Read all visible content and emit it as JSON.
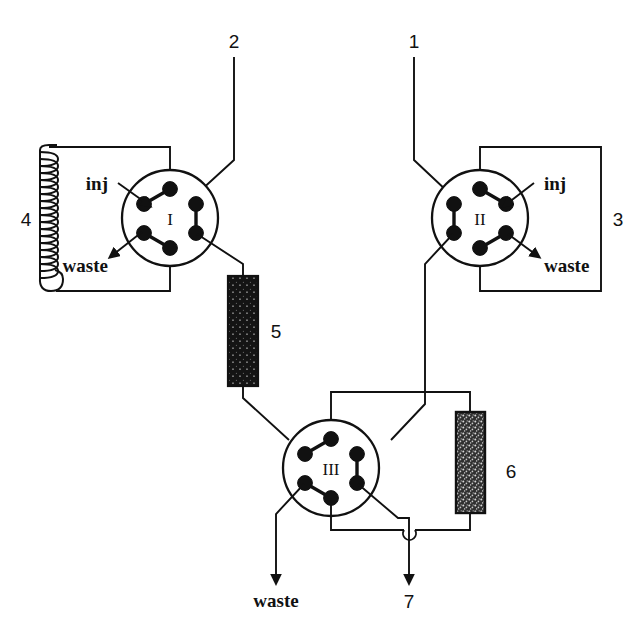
{
  "figure": {
    "background_color": "#ffffff",
    "line_color": "#111111",
    "column_fill_dark": "#1a1a1a",
    "column_fill_speckled": "#3a3a3a",
    "width": 639,
    "height": 630
  },
  "valves": [
    {
      "id": "valve-1",
      "label": "I",
      "inj_label": "inj",
      "waste_label": "waste",
      "cx": 170,
      "cy": 218,
      "r": 48
    },
    {
      "id": "valve-2",
      "label": "II",
      "inj_label": "inj",
      "waste_label": "waste",
      "cx": 480,
      "cy": 218,
      "r": 48
    },
    {
      "id": "valve-3",
      "label": "III",
      "cx": 331,
      "cy": 468,
      "r": 48
    }
  ],
  "stream_labels": {
    "inlet_2": "2",
    "inlet_1": "1",
    "loop_left": "4",
    "loop_right": "3",
    "column_5": "5",
    "column_6": "6",
    "outlet_7": "7",
    "waste_left": "waste",
    "waste_right": "waste",
    "waste_bottom": "waste"
  },
  "components": [
    {
      "name": "sample-loop-coil",
      "number": "4",
      "kind": "helical-coil"
    },
    {
      "name": "sample-loop-rect",
      "number": "3",
      "kind": "rectangular-loop"
    },
    {
      "name": "precolumn",
      "number": "5",
      "kind": "packed-column-dark"
    },
    {
      "name": "analytical-column",
      "number": "6",
      "kind": "packed-column-speckled"
    }
  ],
  "outlets": [
    {
      "name": "waste-valve-1",
      "label": "waste"
    },
    {
      "name": "waste-valve-2",
      "label": "waste"
    },
    {
      "name": "waste-valve-3",
      "label": "waste"
    },
    {
      "name": "detector-outlet",
      "label": "7"
    }
  ],
  "inlets": [
    {
      "name": "pump-inlet-2",
      "label": "2"
    },
    {
      "name": "pump-inlet-1",
      "label": "1"
    }
  ]
}
